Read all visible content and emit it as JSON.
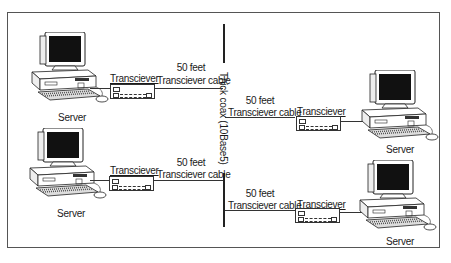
{
  "diagram": {
    "backbone": {
      "label": "Thick coax (10Base5)"
    },
    "nodes": [
      {
        "id": "server-top-left",
        "label": "Server",
        "transceiver_label": "Transciever",
        "cable_length": "50 feet",
        "cable_label": "Transciever cable",
        "side": "left"
      },
      {
        "id": "server-bottom-left",
        "label": "Server",
        "transceiver_label": "Transciever",
        "cable_length": "50 feet",
        "cable_label": "Transciever cable",
        "side": "left"
      },
      {
        "id": "server-top-right",
        "label": "Server",
        "transceiver_label": "Transciever",
        "cable_length": "50 feet",
        "cable_label": "Transciever cable",
        "side": "right"
      },
      {
        "id": "server-bottom-right",
        "label": "Server",
        "transceiver_label": "Transciever",
        "cable_length": "50 feet",
        "cable_label": "Transciever cable",
        "side": "right"
      }
    ],
    "icons": {
      "computer": "desktop-computer-icon",
      "transceiver": "transceiver-icon"
    }
  }
}
